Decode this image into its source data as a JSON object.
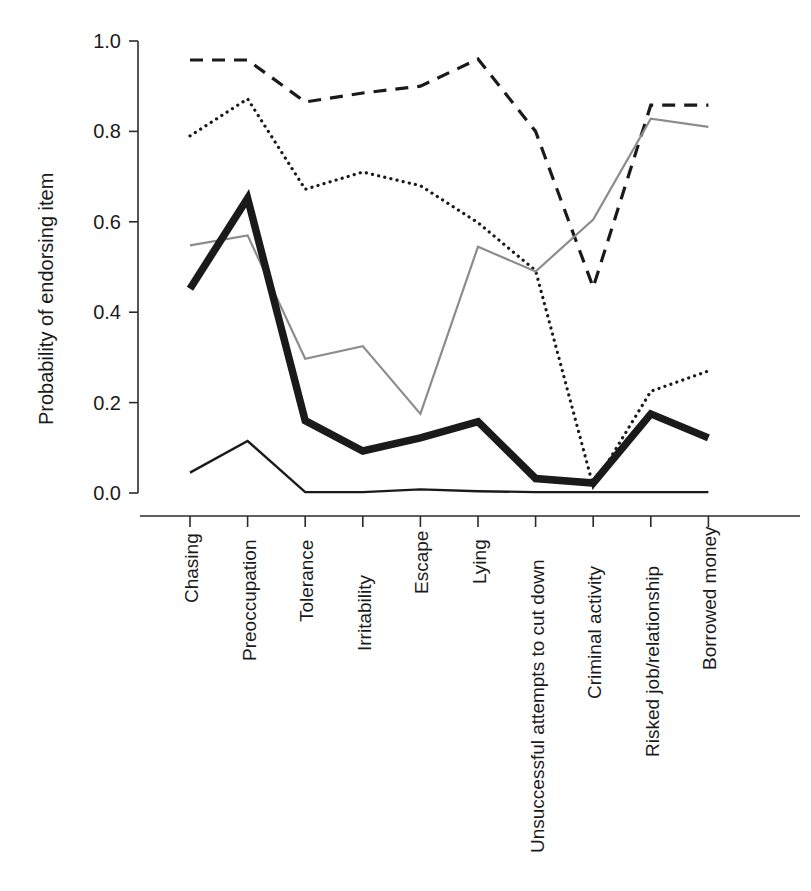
{
  "chart_data": {
    "type": "line",
    "title": "",
    "xlabel": "",
    "ylabel": "Probability of endorsing item",
    "ylim": [
      0.0,
      1.0
    ],
    "grid": false,
    "legend": "none",
    "ytick_labels": [
      "1.0",
      "0.8",
      "0.6",
      "0.4",
      "0.2",
      "0.0"
    ],
    "ytick_values": [
      1.0,
      0.8,
      0.6,
      0.4,
      0.2,
      0.0
    ],
    "categories": [
      "Chasing",
      "Preoccupation",
      "Tolerance",
      "Irritability",
      "Escape",
      "Lying",
      "Unsuccessful attempts to cut down",
      "Criminal activity",
      "Risked job/relationship",
      "Borrowed money"
    ],
    "series": [
      {
        "name": "dashed-series",
        "style": "dashed",
        "color": "#1a1a1a",
        "width": 3.2,
        "values": [
          0.958,
          0.958,
          0.865,
          0.885,
          0.9,
          0.96,
          0.8,
          0.455,
          0.858,
          0.858
        ]
      },
      {
        "name": "dotted-series",
        "style": "dotted",
        "color": "#1a1a1a",
        "width": 3.2,
        "values": [
          0.79,
          0.872,
          0.672,
          0.71,
          0.68,
          0.598,
          0.492,
          0.015,
          0.225,
          0.27
        ]
      },
      {
        "name": "gray-solid-series",
        "style": "solid",
        "color": "#8c8c8c",
        "width": 2.2,
        "values": [
          0.548,
          0.57,
          0.297,
          0.325,
          0.175,
          0.545,
          0.49,
          0.605,
          0.828,
          0.81
        ]
      },
      {
        "name": "thick-black-series",
        "style": "solid",
        "color": "#1a1a1a",
        "width": 7.5,
        "values": [
          0.452,
          0.652,
          0.16,
          0.093,
          0.122,
          0.158,
          0.032,
          0.022,
          0.175,
          0.122
        ]
      },
      {
        "name": "thin-black-series",
        "style": "solid",
        "color": "#1a1a1a",
        "width": 2.4,
        "values": [
          0.045,
          0.115,
          0.002,
          0.002,
          0.008,
          0.004,
          0.002,
          0.002,
          0.002,
          0.002
        ]
      }
    ]
  },
  "axes": {
    "y_axis_name": "y-axis",
    "x_axis_name": "x-axis"
  }
}
